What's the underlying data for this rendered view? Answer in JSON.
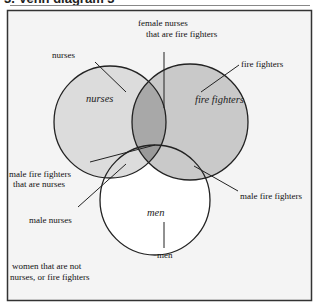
{
  "title": "3. Venn diagram 3",
  "colors": {
    "background": "#f4f4f4",
    "frame": "#333333",
    "nurses_fill": "#dcdcdc",
    "fire_fighters_fill": "#c9c9c9",
    "men_fill": "#ffffff",
    "overlap_nurse_fire": "#a8a8a8",
    "overlap_all": "#9a9a9a",
    "stroke": "#222222"
  },
  "circles": {
    "nurses": {
      "label": "nurses"
    },
    "fire_fighters": {
      "label": "fire fighters"
    },
    "men": {
      "label": "men"
    }
  },
  "callouts": {
    "female_nurses_fire_line1": "female nurses",
    "female_nurses_fire_line2": "that are fire fighters",
    "nurses": "nurses",
    "fire_fighters": "fire fighters",
    "male_fire_nurses_line1": "male fire fighters",
    "male_fire_nurses_line2": "that are nurses",
    "male_nurses": "male nurses",
    "male_fire_fighters": "male fire fighters",
    "men": "men",
    "women_not_line1": "women that are not",
    "women_not_line2": "nurses, or fire fighters"
  }
}
